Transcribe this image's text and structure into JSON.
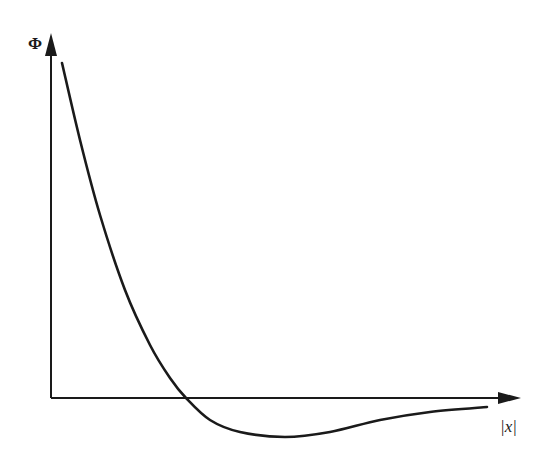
{
  "chart_data": {
    "type": "line",
    "title": "",
    "xlabel": "|x|",
    "ylabel": "Φ",
    "grid": false,
    "legend": null,
    "series": [
      {
        "name": "Φ(|x|)",
        "points_px": [
          [
            62,
            63
          ],
          [
            80,
            140
          ],
          [
            100,
            215
          ],
          [
            125,
            290
          ],
          [
            150,
            345
          ],
          [
            170,
            378
          ],
          [
            186,
            398
          ],
          [
            210,
            420
          ],
          [
            240,
            432
          ],
          [
            285,
            437
          ],
          [
            330,
            432
          ],
          [
            380,
            420
          ],
          [
            430,
            412
          ],
          [
            487,
            407
          ]
        ]
      }
    ],
    "features": {
      "zero_crossing_px": [
        186,
        398
      ],
      "minimum_px": [
        285,
        437
      ]
    },
    "axes": {
      "origin_px": [
        51,
        398
      ],
      "y_axis_top_px": [
        51,
        33
      ],
      "x_axis_right_px": [
        521,
        398
      ]
    },
    "colors": {
      "stroke": "#1a1a1a",
      "background": "#ffffff"
    }
  }
}
